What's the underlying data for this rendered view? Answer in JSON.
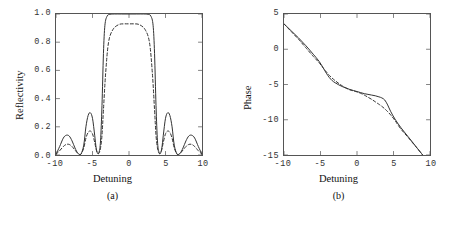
{
  "figure": {
    "width": 451,
    "height": 226,
    "background": "#ffffff",
    "line_color": "#333333"
  },
  "chart_data": [
    {
      "type": "line",
      "panel_label": "(a)",
      "title": "",
      "xlabel": "Detuning",
      "ylabel": "Reflectivity",
      "xlim": [
        -10,
        10
      ],
      "ylim": [
        0.0,
        1.0
      ],
      "xticks": [
        -10,
        -5,
        0,
        5,
        10
      ],
      "xticklabels": [
        "-10",
        "-5",
        "0",
        "5",
        "10"
      ],
      "yticks": [
        0.0,
        0.2,
        0.4,
        0.6,
        0.8,
        1.0
      ],
      "yticklabels": [
        "0.0",
        "0.2",
        "0.4",
        "0.6",
        "0.8",
        "1.0"
      ],
      "grid": false,
      "legend": "none",
      "series": [
        {
          "name": "solid",
          "style": "solid",
          "x": [
            -10.0,
            -9.5,
            -9.0,
            -8.6,
            -8.2,
            -7.8,
            -7.4,
            -7.0,
            -6.6,
            -6.2,
            -5.9,
            -5.6,
            -5.3,
            -5.0,
            -4.7,
            -4.5,
            -4.3,
            -4.1,
            -3.9,
            -3.7,
            -3.5,
            -3.3,
            -3.0,
            -2.6,
            -2.0,
            -1.0,
            0.0,
            1.0,
            2.0,
            2.6,
            3.0,
            3.3,
            3.5,
            3.7,
            3.9,
            4.1,
            4.3,
            4.5,
            4.7,
            5.0,
            5.3,
            5.6,
            5.9,
            6.2,
            6.6,
            7.0,
            7.4,
            7.8,
            8.2,
            8.6,
            9.0,
            9.5,
            10.0
          ],
          "y": [
            0.005,
            0.06,
            0.12,
            0.14,
            0.135,
            0.1,
            0.05,
            0.012,
            0.005,
            0.07,
            0.2,
            0.28,
            0.3,
            0.26,
            0.14,
            0.05,
            0.012,
            0.02,
            0.1,
            0.35,
            0.72,
            0.92,
            0.985,
            0.998,
            1.0,
            1.0,
            1.0,
            1.0,
            1.0,
            0.998,
            0.985,
            0.92,
            0.72,
            0.35,
            0.1,
            0.02,
            0.012,
            0.05,
            0.14,
            0.26,
            0.3,
            0.28,
            0.2,
            0.07,
            0.005,
            0.012,
            0.05,
            0.1,
            0.135,
            0.14,
            0.12,
            0.06,
            0.005
          ]
        },
        {
          "name": "dashed",
          "style": "dashed",
          "x": [
            -10.0,
            -9.5,
            -9.0,
            -8.6,
            -8.2,
            -7.8,
            -7.4,
            -7.0,
            -6.6,
            -6.2,
            -5.9,
            -5.6,
            -5.3,
            -5.0,
            -4.7,
            -4.5,
            -4.3,
            -4.1,
            -3.9,
            -3.7,
            -3.5,
            -3.2,
            -2.8,
            -2.2,
            -1.4,
            -0.7,
            0.0,
            0.7,
            1.4,
            2.2,
            2.8,
            3.2,
            3.5,
            3.7,
            3.9,
            4.1,
            4.3,
            4.5,
            4.7,
            5.0,
            5.3,
            5.6,
            5.9,
            6.2,
            6.6,
            7.0,
            7.4,
            7.8,
            8.2,
            8.6,
            9.0,
            9.5,
            10.0
          ],
          "y": [
            0.005,
            0.03,
            0.06,
            0.075,
            0.075,
            0.06,
            0.035,
            0.012,
            0.005,
            0.05,
            0.12,
            0.16,
            0.17,
            0.15,
            0.09,
            0.04,
            0.012,
            0.015,
            0.05,
            0.14,
            0.32,
            0.58,
            0.8,
            0.89,
            0.925,
            0.93,
            0.93,
            0.93,
            0.925,
            0.89,
            0.8,
            0.58,
            0.32,
            0.14,
            0.05,
            0.015,
            0.012,
            0.04,
            0.09,
            0.15,
            0.17,
            0.16,
            0.12,
            0.05,
            0.005,
            0.012,
            0.035,
            0.06,
            0.075,
            0.075,
            0.06,
            0.03,
            0.005
          ]
        }
      ]
    },
    {
      "type": "line",
      "panel_label": "(b)",
      "title": "",
      "xlabel": "Detuning",
      "ylabel": "Phase",
      "xlim": [
        -10,
        10
      ],
      "ylim": [
        -15,
        5
      ],
      "xticks": [
        -10,
        -5,
        0,
        5,
        10
      ],
      "xticklabels": [
        "-10",
        "-5",
        "0",
        "5",
        "10"
      ],
      "yticks": [
        -15,
        -10,
        -5,
        0,
        5
      ],
      "yticklabels": [
        "-15",
        "-10",
        "-5",
        "0",
        "5"
      ],
      "grid": false,
      "legend": "none",
      "series": [
        {
          "name": "solid",
          "style": "solid",
          "x": [
            -10.0,
            -9.0,
            -8.0,
            -7.0,
            -6.0,
            -5.2,
            -4.6,
            -4.2,
            -3.8,
            -3.4,
            -3.0,
            -2.5,
            -2.0,
            -1.5,
            -1.0,
            -0.5,
            0.0,
            0.5,
            1.0,
            1.5,
            2.0,
            2.5,
            3.0,
            3.4,
            3.8,
            4.2,
            4.6,
            5.2,
            6.0,
            7.0,
            8.0,
            9.0
          ],
          "y": [
            3.6,
            2.6,
            1.6,
            0.5,
            -0.7,
            -1.7,
            -2.7,
            -3.4,
            -4.0,
            -4.45,
            -4.75,
            -5.05,
            -5.3,
            -5.5,
            -5.7,
            -5.85,
            -6.0,
            -6.15,
            -6.3,
            -6.4,
            -6.5,
            -6.6,
            -6.75,
            -6.9,
            -7.2,
            -7.9,
            -8.8,
            -9.9,
            -11.1,
            -12.4,
            -13.7,
            -15.0
          ]
        },
        {
          "name": "dashed",
          "style": "dashed",
          "x": [
            -10.0,
            -9.0,
            -8.0,
            -7.0,
            -6.0,
            -5.2,
            -4.6,
            -4.2,
            -3.8,
            -3.4,
            -3.0,
            -2.5,
            -2.0,
            -1.5,
            -1.0,
            -0.5,
            0.0,
            0.5,
            1.0,
            1.5,
            2.0,
            2.5,
            3.0,
            3.4,
            3.8,
            4.2,
            4.6,
            5.2,
            6.0,
            7.0,
            8.0,
            9.0
          ],
          "y": [
            3.6,
            2.5,
            1.4,
            0.2,
            -1.0,
            -1.9,
            -2.7,
            -3.2,
            -3.7,
            -4.1,
            -4.45,
            -4.85,
            -5.2,
            -5.5,
            -5.75,
            -5.9,
            -6.05,
            -6.25,
            -6.5,
            -6.8,
            -7.1,
            -7.45,
            -7.8,
            -8.1,
            -8.45,
            -8.85,
            -9.3,
            -10.1,
            -11.3,
            -12.5,
            -13.75,
            -15.0
          ]
        }
      ]
    }
  ]
}
